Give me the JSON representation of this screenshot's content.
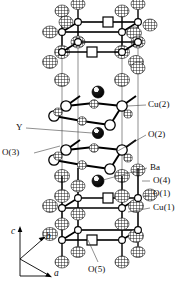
{
  "figure": {
    "background": "#ffffff",
    "line_color": "#000000"
  },
  "labels": {
    "cu2": "Cu(2)",
    "o2": "O(2)",
    "ba": "Ba",
    "o4": "O(4)",
    "o1": "O(1)",
    "cu1": "Cu(1)",
    "y": "Y",
    "o3": "O(3)",
    "o5": "O(5)"
  },
  "axes": {
    "c": "c",
    "b": "b",
    "a": "a"
  },
  "atom_legend": [
    {
      "name": "Cu(2)",
      "glyph": "open-circle",
      "note": "plane copper, large white sphere"
    },
    {
      "name": "O(2)",
      "glyph": "hatched-circle",
      "note": "plane oxygen, small cross-hatched sphere"
    },
    {
      "name": "O(3)",
      "glyph": "hatched-circle",
      "note": "plane oxygen, small cross-hatched sphere"
    },
    {
      "name": "Ba",
      "glyph": "shaded-sphere",
      "note": "dark sphere with highlight"
    },
    {
      "name": "Y",
      "glyph": "shaded-sphere",
      "note": "dark sphere with highlight"
    },
    {
      "name": "O(4)",
      "glyph": "hatched-ellipsoid",
      "note": "apical oxygen"
    },
    {
      "name": "O(1)",
      "glyph": "hatched-ellipsoid",
      "note": "chain oxygen"
    },
    {
      "name": "Cu(1)",
      "glyph": "small-dark-circle",
      "note": "chain copper"
    },
    {
      "name": "O(5)",
      "glyph": "open-square",
      "note": "vacant chain oxygen site"
    }
  ]
}
